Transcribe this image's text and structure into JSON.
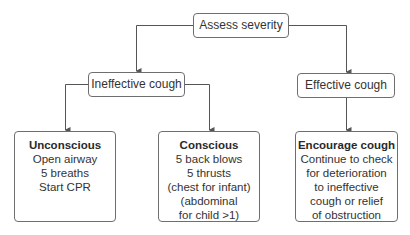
{
  "diagram": {
    "type": "flowchart",
    "colors": {
      "line": "#555555",
      "border": "#6e6e6e",
      "text": "#333333"
    },
    "nodes": {
      "root": {
        "label": "Assess severity"
      },
      "ineffective": {
        "label": "Ineffective cough"
      },
      "effective": {
        "label": "Effective cough"
      },
      "unconscious": {
        "title": "Unconscious",
        "lines": [
          "Open airway",
          "5 breaths",
          "Start CPR"
        ]
      },
      "conscious": {
        "title": "Conscious",
        "lines": [
          "5 back blows",
          "5 thrusts",
          "(chest for infant)",
          "(abdominal",
          "for child >1)"
        ]
      },
      "encourage": {
        "title": "Encourage cough",
        "lines": [
          "Continue to check",
          "for deterioration",
          "to ineffective",
          "cough or relief",
          "of obstruction"
        ]
      }
    },
    "edges": [
      {
        "from": "Assess severity",
        "to": "Ineffective cough"
      },
      {
        "from": "Assess severity",
        "to": "Effective cough"
      },
      {
        "from": "Ineffective cough",
        "to": "Unconscious"
      },
      {
        "from": "Ineffective cough",
        "to": "Conscious"
      },
      {
        "from": "Effective cough",
        "to": "Encourage cough"
      }
    ]
  }
}
